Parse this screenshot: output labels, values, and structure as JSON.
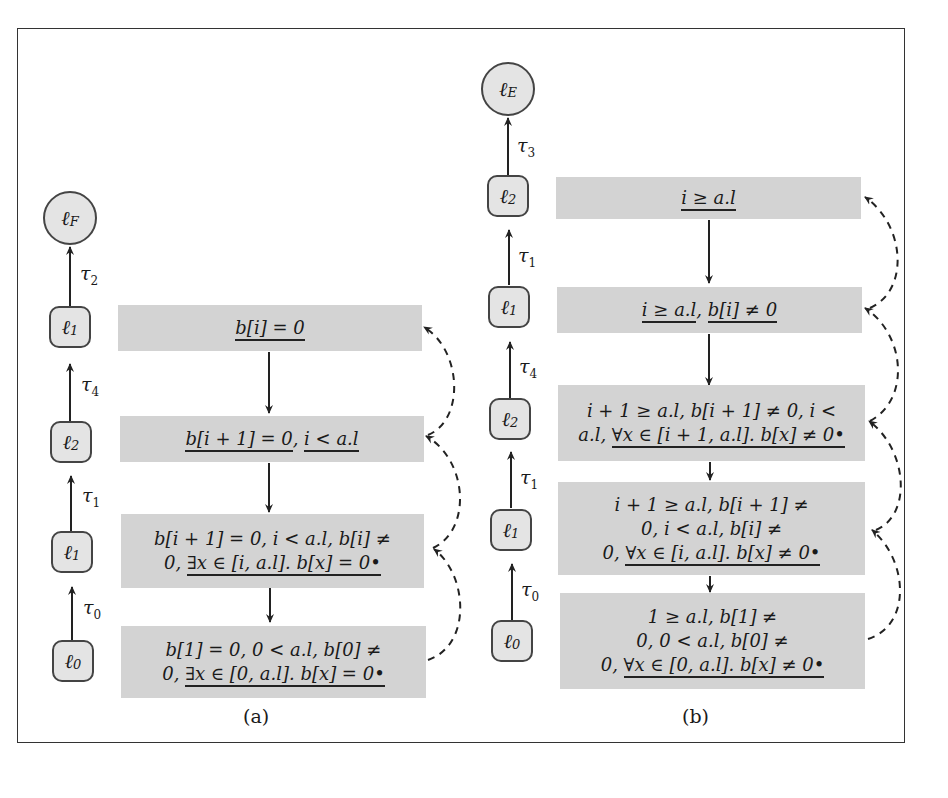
{
  "figure": {
    "subfigures": [
      {
        "caption": "(a)",
        "path": {
          "nodes": [
            {
              "id": "lF",
              "label": "ℓ",
              "sub": "F",
              "shape": "circle"
            },
            {
              "id": "l1",
              "label": "ℓ",
              "sub": "1",
              "shape": "box"
            },
            {
              "id": "l2",
              "label": "ℓ",
              "sub": "2",
              "shape": "box"
            },
            {
              "id": "l1b",
              "label": "ℓ",
              "sub": "1",
              "shape": "box"
            },
            {
              "id": "l0",
              "label": "ℓ",
              "sub": "0",
              "shape": "box"
            }
          ],
          "transitions": [
            {
              "label": "τ",
              "sub": "2"
            },
            {
              "label": "τ",
              "sub": "4"
            },
            {
              "label": "τ",
              "sub": "1"
            },
            {
              "label": "τ",
              "sub": "0"
            }
          ]
        },
        "states": [
          {
            "pre": "",
            "underlined": "b[i] = 0",
            "post": ""
          },
          {
            "pre": "",
            "underlined": "b[i + 1] = 0",
            "mid": ", ",
            "underlined2": "i < a.l",
            "post": ""
          },
          {
            "line1": "b[i + 1] = 0, i < a.l, b[i] ≠",
            "line2_pre": "0, ",
            "line2_u": "∃x ∈ [i, a.l]. b[x] = 0•"
          },
          {
            "line1": "b[1] = 0, 0 < a.l, b[0] ≠",
            "line2_pre": "0, ",
            "line2_u": "∃x ∈ [0, a.l]. b[x] = 0•"
          }
        ]
      },
      {
        "caption": "(b)",
        "path": {
          "nodes": [
            {
              "id": "lE",
              "label": "ℓ",
              "sub": "E",
              "shape": "circle"
            },
            {
              "id": "l2",
              "label": "ℓ",
              "sub": "2",
              "shape": "box"
            },
            {
              "id": "l1",
              "label": "ℓ",
              "sub": "1",
              "shape": "box"
            },
            {
              "id": "l2b",
              "label": "ℓ",
              "sub": "2",
              "shape": "box"
            },
            {
              "id": "l1b",
              "label": "ℓ",
              "sub": "1",
              "shape": "box"
            },
            {
              "id": "l0",
              "label": "ℓ",
              "sub": "0",
              "shape": "box"
            }
          ],
          "transitions": [
            {
              "label": "τ",
              "sub": "3"
            },
            {
              "label": "τ",
              "sub": "1"
            },
            {
              "label": "τ",
              "sub": "4"
            },
            {
              "label": "τ",
              "sub": "1"
            },
            {
              "label": "τ",
              "sub": "0"
            }
          ]
        },
        "states": [
          {
            "underlined": "i ≥ a.l"
          },
          {
            "underlined": "i ≥ a.l",
            "mid": ", ",
            "underlined2": "b[i] ≠ 0"
          },
          {
            "line1": "i + 1 ≥ a.l, b[i + 1] ≠ 0, i <",
            "line2_pre": "a.l, ",
            "line2_u": "∀x ∈ [i + 1, a.l]. b[x] ≠ 0•"
          },
          {
            "line1": "i + 1 ≥ a.l, b[i + 1] ≠",
            "line2": "0, i < a.l, b[i] ≠",
            "line3_pre": "0, ",
            "line3_u": "∀x ∈ [i, a.l]. b[x] ≠ 0•"
          },
          {
            "line1": "1 ≥ a.l, b[1] ≠",
            "line2": "0, 0 < a.l, b[0] ≠",
            "line3_pre": "0, ",
            "line3_u": "∀x ∈ [0, a.l]. b[x] ≠ 0•"
          }
        ]
      }
    ]
  },
  "colors": {
    "state_fill": "#d3d3d3",
    "node_fill": "#e4e4e4",
    "stroke": "#333333"
  }
}
